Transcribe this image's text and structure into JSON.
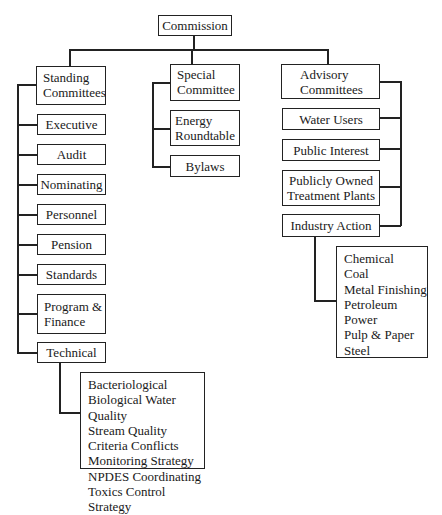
{
  "chart_title": "Commission organizational chart",
  "root": {
    "label": "Commission"
  },
  "standing": {
    "label_line1": "Standing",
    "label_line2": "Committees",
    "children": [
      {
        "label": "Executive"
      },
      {
        "label": "Audit"
      },
      {
        "label": "Nominating"
      },
      {
        "label": "Personnel"
      },
      {
        "label": "Pension"
      },
      {
        "label": "Standards"
      },
      {
        "label_line1": "Program &",
        "label_line2": "Finance"
      },
      {
        "label": "Technical"
      }
    ],
    "technical_subcommittees": [
      "Bacteriological",
      "Biological Water Quality",
      "Stream Quality Criteria Conflicts",
      "Monitoring Strategy",
      "NPDES Coordinating",
      "Toxics Control Strategy"
    ]
  },
  "special": {
    "label_line1": "Special",
    "label_line2": "Committee",
    "children": [
      {
        "label_line1": "Energy",
        "label_line2": "Roundtable"
      },
      {
        "label": "Bylaws"
      }
    ]
  },
  "advisory": {
    "label_line1": "Advisory",
    "label_line2": "Committees",
    "children": [
      {
        "label": "Water Users"
      },
      {
        "label": "Public Interest"
      },
      {
        "label_line1": "Publicly Owned",
        "label_line2": "Treatment Plants"
      },
      {
        "label": "Industry Action"
      }
    ],
    "industry_subcommittees": [
      "Chemical",
      "Coal",
      "Metal Finishing",
      "Petroleum",
      "Power",
      "Pulp & Paper",
      "Steel"
    ]
  },
  "colors": {
    "line": "#222222",
    "background": "#ffffff",
    "text": "#1a1a1a"
  }
}
